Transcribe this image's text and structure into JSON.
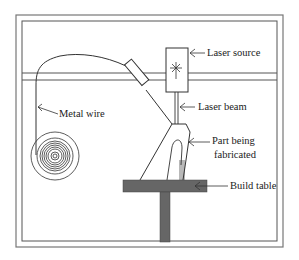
{
  "diagram": {
    "type": "wire-fed laser additive manufacturing setup",
    "labels": {
      "laser_source": "Laser source",
      "laser_beam": "Laser beam",
      "metal_wire": "Metal wire",
      "part_line1": "Part being",
      "part_line2": "fabricated",
      "build_table": "Build table"
    },
    "colors": {
      "line": "#333333",
      "table": "#666666",
      "frame": "#555555"
    }
  }
}
